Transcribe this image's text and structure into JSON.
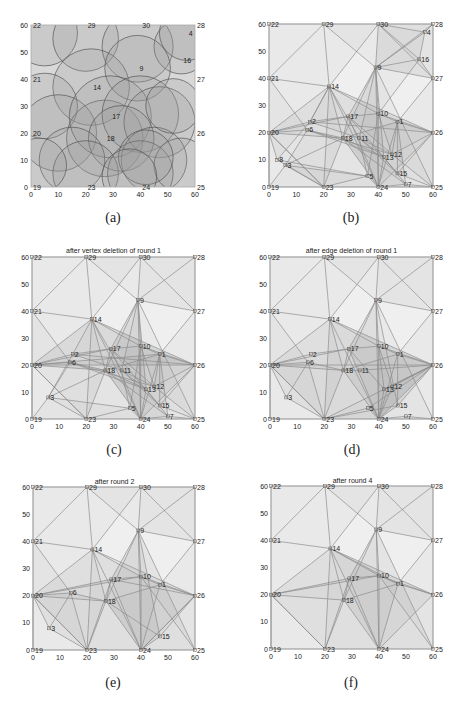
{
  "figure": {
    "panels": [
      {
        "id": "a",
        "caption": "(a)",
        "title": "",
        "kind": "coverage"
      },
      {
        "id": "b",
        "caption": "(b)",
        "title": "",
        "kind": "graph"
      },
      {
        "id": "c",
        "caption": "(c)",
        "title": "after vertex deletion of round 1",
        "kind": "graph"
      },
      {
        "id": "d",
        "caption": "(d)",
        "title": "after edge deletion of round 1",
        "kind": "graph"
      },
      {
        "id": "e",
        "caption": "(e)",
        "title": "after round 2",
        "kind": "graph"
      },
      {
        "id": "f",
        "caption": "(f)",
        "title": "after round 4",
        "kind": "graph"
      }
    ],
    "axis": {
      "xticks": [
        "0",
        "10",
        "20",
        "30",
        "40",
        "50",
        "60"
      ],
      "yticks": [
        "0",
        "10",
        "20",
        "30",
        "40",
        "50",
        "60"
      ],
      "xlim": [
        0,
        60
      ],
      "ylim": [
        0,
        60
      ]
    },
    "colors": {
      "edge": "#8a8a8a",
      "fill": "#d9d9d9",
      "circle_fill": "#9a9a9a",
      "circle_stroke": "#555555",
      "frame": "#aaaaaa",
      "text": "#222222"
    }
  },
  "chart_data": {
    "type": "scatter",
    "xlabel": "",
    "ylabel": "",
    "xlim": [
      0,
      60
    ],
    "ylim": [
      0,
      60
    ],
    "nodes": {
      "1": [
        47,
        24
      ],
      "2": [
        15,
        24
      ],
      "3": [
        6,
        8
      ],
      "4": [
        57,
        57
      ],
      "5": [
        36,
        4
      ],
      "6": [
        14,
        21
      ],
      "7": [
        50,
        1
      ],
      "8": [
        3,
        10
      ],
      "9": [
        39,
        44
      ],
      "10": [
        40,
        27
      ],
      "11": [
        33,
        18
      ],
      "12": [
        45,
        12
      ],
      "13": [
        42,
        11
      ],
      "14": [
        22,
        37
      ],
      "15": [
        47,
        5
      ],
      "16": [
        55,
        47
      ],
      "17": [
        29,
        26
      ],
      "18": [
        27,
        18
      ],
      "19": [
        0,
        0
      ],
      "20": [
        0,
        20
      ],
      "21": [
        0,
        40
      ],
      "22": [
        0,
        60
      ],
      "23": [
        20,
        0
      ],
      "24": [
        40,
        0
      ],
      "25": [
        60,
        0
      ],
      "26": [
        60,
        20
      ],
      "27": [
        60,
        40
      ],
      "28": [
        60,
        60
      ],
      "29": [
        20,
        60
      ],
      "30": [
        40,
        60
      ]
    },
    "panels": {
      "a": {
        "labels": [
          "22",
          "29",
          "30",
          "28",
          "4",
          "16",
          "9",
          "21",
          "27",
          "14",
          "17",
          "20",
          "18",
          "26",
          "19",
          "23",
          "24",
          "25"
        ],
        "circles": [
          [
            5,
            57,
            12
          ],
          [
            20,
            55,
            12
          ],
          [
            39,
            52,
            13
          ],
          [
            55,
            52,
            10
          ],
          [
            57,
            57,
            10
          ],
          [
            22,
            37,
            14
          ],
          [
            39,
            44,
            12
          ],
          [
            5,
            30,
            12
          ],
          [
            10,
            20,
            14
          ],
          [
            27,
            18,
            14
          ],
          [
            29,
            26,
            15
          ],
          [
            40,
            27,
            14
          ],
          [
            47,
            24,
            13
          ],
          [
            33,
            18,
            12
          ],
          [
            15,
            10,
            12
          ],
          [
            45,
            10,
            12
          ],
          [
            20,
            5,
            12
          ],
          [
            40,
            5,
            12
          ],
          [
            55,
            8,
            10
          ],
          [
            52,
            30,
            10
          ],
          [
            3,
            8,
            10
          ],
          [
            42,
            11,
            10
          ],
          [
            36,
            4,
            10
          ]
        ]
      },
      "b": {
        "labels": [
          "1",
          "2",
          "3",
          "4",
          "5",
          "6",
          "7",
          "8",
          "9",
          "10",
          "11",
          "12",
          "13",
          "14",
          "15",
          "16",
          "17",
          "18",
          "19",
          "20",
          "21",
          "22",
          "23",
          "24",
          "25",
          "26",
          "27",
          "28",
          "29",
          "30"
        ]
      },
      "c": {
        "labels": [
          "1",
          "2",
          "3",
          "5",
          "6",
          "7",
          "9",
          "10",
          "11",
          "12",
          "13",
          "14",
          "15",
          "17",
          "18",
          "19",
          "20",
          "21",
          "22",
          "23",
          "24",
          "25",
          "26",
          "27",
          "28",
          "29",
          "30"
        ]
      },
      "d": {
        "labels": [
          "1",
          "2",
          "3",
          "5",
          "6",
          "7",
          "9",
          "10",
          "11",
          "12",
          "13",
          "14",
          "15",
          "17",
          "18",
          "19",
          "20",
          "21",
          "22",
          "23",
          "24",
          "25",
          "26",
          "27",
          "28",
          "29",
          "30"
        ]
      },
      "e": {
        "labels": [
          "1",
          "3",
          "6",
          "9",
          "10",
          "14",
          "15",
          "17",
          "18",
          "19",
          "20",
          "21",
          "22",
          "23",
          "24",
          "25",
          "26",
          "27",
          "28",
          "29",
          "30"
        ]
      },
      "f": {
        "labels": [
          "1",
          "9",
          "10",
          "14",
          "17",
          "18",
          "19",
          "20",
          "21",
          "22",
          "23",
          "24",
          "25",
          "26",
          "27",
          "28",
          "29",
          "30"
        ]
      }
    },
    "edges": {
      "base": [
        [
          22,
          29
        ],
        [
          29,
          30
        ],
        [
          30,
          28
        ],
        [
          22,
          21
        ],
        [
          21,
          20
        ],
        [
          20,
          19
        ],
        [
          19,
          23
        ],
        [
          23,
          24
        ],
        [
          24,
          25
        ],
        [
          25,
          26
        ],
        [
          26,
          27
        ],
        [
          27,
          28
        ],
        [
          21,
          29
        ],
        [
          29,
          9
        ],
        [
          30,
          9
        ],
        [
          30,
          27
        ],
        [
          28,
          9
        ],
        [
          9,
          27
        ],
        [
          21,
          14
        ],
        [
          29,
          14
        ],
        [
          14,
          30
        ],
        [
          14,
          20
        ],
        [
          14,
          23
        ],
        [
          14,
          24
        ],
        [
          14,
          18
        ],
        [
          14,
          10
        ],
        [
          14,
          26
        ],
        [
          9,
          17
        ],
        [
          9,
          10
        ],
        [
          9,
          24
        ],
        [
          9,
          18
        ],
        [
          9,
          25
        ],
        [
          20,
          17
        ],
        [
          20,
          18
        ],
        [
          20,
          23
        ],
        [
          17,
          10
        ],
        [
          17,
          24
        ],
        [
          17,
          18
        ],
        [
          10,
          1
        ],
        [
          10,
          24
        ],
        [
          10,
          26
        ],
        [
          18,
          1
        ],
        [
          18,
          23
        ],
        [
          18,
          24
        ],
        [
          1,
          26
        ],
        [
          1,
          24
        ],
        [
          1,
          27
        ],
        [
          26,
          24
        ],
        [
          23,
          20
        ],
        [
          19,
          20
        ]
      ],
      "b_extra": [
        [
          30,
          4
        ],
        [
          30,
          16
        ],
        [
          4,
          16
        ],
        [
          4,
          28
        ],
        [
          16,
          27
        ],
        [
          16,
          9
        ],
        [
          16,
          10
        ],
        [
          4,
          9
        ],
        [
          2,
          14
        ],
        [
          2,
          20
        ],
        [
          6,
          20
        ],
        [
          2,
          17
        ],
        [
          6,
          18
        ],
        [
          8,
          20
        ],
        [
          3,
          19
        ],
        [
          3,
          6
        ],
        [
          3,
          23
        ],
        [
          8,
          2
        ],
        [
          11,
          13
        ],
        [
          11,
          12
        ],
        [
          12,
          26
        ],
        [
          13,
          24
        ],
        [
          5,
          23
        ],
        [
          5,
          24
        ],
        [
          7,
          25
        ],
        [
          15,
          25
        ],
        [
          15,
          26
        ],
        [
          7,
          24
        ],
        [
          13,
          18
        ],
        [
          12,
          17
        ],
        [
          11,
          5
        ],
        [
          2,
          11
        ],
        [
          6,
          13
        ],
        [
          6,
          12
        ],
        [
          3,
          18
        ],
        [
          8,
          5
        ],
        [
          8,
          23
        ],
        [
          10,
          12
        ],
        [
          1,
          12
        ],
        [
          1,
          15
        ],
        [
          17,
          15
        ],
        [
          18,
          7
        ],
        [
          14,
          11
        ],
        [
          14,
          2
        ],
        [
          21,
          6
        ],
        [
          2,
          26
        ],
        [
          9,
          11
        ],
        [
          9,
          13
        ],
        [
          1,
          7
        ],
        [
          10,
          5
        ],
        [
          11,
          15
        ],
        [
          3,
          5
        ],
        [
          12,
          25
        ],
        [
          13,
          7
        ]
      ],
      "c_extra": [
        [
          2,
          14
        ],
        [
          2,
          20
        ],
        [
          6,
          20
        ],
        [
          2,
          17
        ],
        [
          6,
          18
        ],
        [
          3,
          19
        ],
        [
          3,
          6
        ],
        [
          3,
          23
        ],
        [
          3,
          2
        ],
        [
          11,
          13
        ],
        [
          11,
          12
        ],
        [
          12,
          26
        ],
        [
          13,
          24
        ],
        [
          5,
          23
        ],
        [
          5,
          24
        ],
        [
          7,
          25
        ],
        [
          15,
          25
        ],
        [
          15,
          26
        ],
        [
          7,
          24
        ],
        [
          13,
          18
        ],
        [
          12,
          17
        ],
        [
          11,
          5
        ],
        [
          2,
          11
        ],
        [
          6,
          13
        ],
        [
          6,
          12
        ],
        [
          3,
          18
        ],
        [
          3,
          5
        ],
        [
          10,
          12
        ],
        [
          1,
          12
        ],
        [
          1,
          15
        ],
        [
          17,
          15
        ],
        [
          18,
          7
        ],
        [
          14,
          11
        ],
        [
          21,
          6
        ],
        [
          2,
          26
        ],
        [
          9,
          11
        ],
        [
          9,
          13
        ],
        [
          1,
          7
        ],
        [
          10,
          5
        ],
        [
          11,
          15
        ],
        [
          12,
          25
        ],
        [
          13,
          7
        ],
        [
          20,
          1
        ],
        [
          20,
          26
        ]
      ],
      "d_extra": [
        [
          2,
          20
        ],
        [
          6,
          20
        ],
        [
          2,
          17
        ],
        [
          6,
          18
        ],
        [
          3,
          6
        ],
        [
          3,
          23
        ],
        [
          3,
          20
        ],
        [
          21,
          6
        ],
        [
          6,
          23
        ],
        [
          11,
          18
        ],
        [
          11,
          26
        ],
        [
          13,
          24
        ],
        [
          13,
          12
        ],
        [
          12,
          26
        ],
        [
          5,
          24
        ],
        [
          5,
          23
        ],
        [
          7,
          24
        ],
        [
          7,
          25
        ],
        [
          15,
          24
        ],
        [
          15,
          26
        ],
        [
          13,
          26
        ],
        [
          12,
          24
        ],
        [
          23,
          26
        ],
        [
          23,
          15
        ],
        [
          5,
          26
        ],
        [
          10,
          12
        ],
        [
          10,
          13
        ],
        [
          1,
          15
        ],
        [
          9,
          15
        ],
        [
          17,
          13
        ],
        [
          20,
          26
        ]
      ],
      "e_extra": [
        [
          20,
          6
        ],
        [
          6,
          23
        ],
        [
          3,
          20
        ],
        [
          3,
          6
        ],
        [
          3,
          23
        ],
        [
          21,
          6
        ],
        [
          6,
          18
        ],
        [
          20,
          10
        ],
        [
          18,
          15
        ],
        [
          15,
          24
        ],
        [
          15,
          26
        ],
        [
          24,
          26
        ],
        [
          10,
          25
        ],
        [
          9,
          15
        ],
        [
          17,
          23
        ],
        [
          17,
          26
        ]
      ],
      "f_extra": [
        [
          20,
          10
        ],
        [
          17,
          23
        ],
        [
          10,
          25
        ],
        [
          14,
          1
        ]
      ]
    },
    "fills": {
      "note": "Gray translucent triangles fill the convex hull of each graph; darker regions where more triangles overlap."
    }
  }
}
